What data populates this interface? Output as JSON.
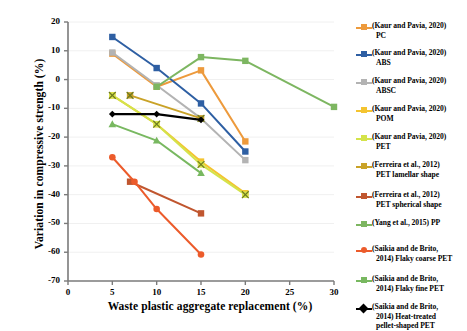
{
  "chart_data": {
    "type": "line",
    "title": "",
    "xlabel": "Waste plastic aggregate replacement (%)",
    "ylabel": "Variation in compressive strength (%)",
    "xlim": [
      0,
      30
    ],
    "ylim": [
      -70,
      20
    ],
    "xticks": [
      0,
      5,
      10,
      15,
      20,
      25,
      30
    ],
    "xticklabels": [
      "0",
      "5",
      "10",
      "15",
      "20",
      "25",
      "30"
    ],
    "yticks": [
      20,
      10,
      0,
      -10,
      -20,
      -30,
      -40,
      -50,
      -60,
      -70
    ],
    "yticklabels": [
      "20",
      "10",
      "0",
      "-10",
      "-20",
      "-30",
      "-40",
      "-50",
      "-60",
      "-70"
    ],
    "grid": false,
    "legend_position": "right",
    "series": [
      {
        "name": "(Kaur and Pavia, 2020) PC",
        "label_line1": "(Kaur and Pavia, 2020)",
        "label_line2": "PC",
        "color": "#ED9A3C",
        "marker": "square",
        "x": [
          5,
          10,
          15,
          20
        ],
        "y": [
          9.0,
          -2.5,
          3.2,
          -21.5
        ]
      },
      {
        "name": "(Kaur and Pavia, 2020) ABS",
        "label_line1": "(Kaur and Pavia, 2020)",
        "label_line2": "ABS",
        "color": "#2E5FA3",
        "marker": "square",
        "x": [
          5,
          10,
          15,
          20
        ],
        "y": [
          14.8,
          4.0,
          -8.3,
          -25.0
        ]
      },
      {
        "name": "(Kaur and Pavia, 2020) ABSC",
        "label_line1": "(Kaur and Pavia, 2020)",
        "label_line2": "ABSC",
        "color": "#B3B3B3",
        "marker": "square",
        "x": [
          5,
          10,
          15,
          20
        ],
        "y": [
          9.4,
          -2.0,
          -13.5,
          -28.0
        ]
      },
      {
        "name": "(Kaur and Pavia, 2020) POM",
        "label_line1": "(Kaur and Pavia, 2020)",
        "label_line2": "POM",
        "color": "#F4C430",
        "marker": "square",
        "x": [
          5,
          10,
          15,
          20
        ],
        "y": [
          -5.5,
          -15.5,
          -28.5,
          -39.5
        ]
      },
      {
        "name": "(Kaur and Pavia, 2020) PET",
        "label_line1": "(Kaur and Pavia, 2020)",
        "label_line2": "PET",
        "color": "#D4E34A",
        "marker": "x-square",
        "x": [
          5,
          10,
          15,
          20
        ],
        "y": [
          -5.5,
          -15.5,
          -29.5,
          -40.0
        ]
      },
      {
        "name": "(Ferreira et al., 2012) PET lamellar shape",
        "label_line1": "(Ferreira et al., 2012)",
        "label_line2": "PET lamellar shape",
        "color": "#C9A227",
        "marker": "x-square",
        "x": [
          7,
          15
        ],
        "y": [
          -5.5,
          -13.5
        ]
      },
      {
        "name": "(Ferreira et al., 2012) PET spherical shape",
        "label_line1": "(Ferreira et al., 2012)",
        "label_line2": "PET spherical shape",
        "color": "#C0562F",
        "marker": "square",
        "x": [
          7,
          15
        ],
        "y": [
          -35.5,
          -46.5
        ]
      },
      {
        "name": "(Yang et al., 2015) PP",
        "label_line1": "(Yang et al., 2015) PP",
        "label_line2": "",
        "color": "#7DB661",
        "marker": "square",
        "x": [
          10,
          15,
          20,
          30
        ],
        "y": [
          -2.5,
          7.8,
          6.5,
          -9.5
        ]
      },
      {
        "name": "(Saikia and de Brito, 2014) Flaky coarse PET",
        "label_line1": "(Saikia and de Brito,",
        "label_line2": "2014) Flaky coarse PET",
        "color": "#EC5B2B",
        "marker": "circle",
        "x": [
          5,
          7.5,
          10,
          15
        ],
        "y": [
          -27.0,
          -35.5,
          -45.0,
          -60.8
        ]
      },
      {
        "name": "(Saikia and de Brito, 2014) Flaky fine PET",
        "label_line1": "(Saikia and de Brito,",
        "label_line2": "2014) Flaky fine PET",
        "color": "#78B860",
        "marker": "triangle",
        "x": [
          5,
          10,
          15
        ],
        "y": [
          -15.5,
          -21.2,
          -32.5
        ]
      },
      {
        "name": "(Saikia and de Brito, 2014) Heat-treated pellet-shaped PET",
        "label_line1": "(Saikia and de Brito,",
        "label_line2": "2014) Heat-treated",
        "label_line3": "pellet-shaped PET",
        "color": "#000000",
        "marker": "diamond",
        "x": [
          5,
          10,
          15
        ],
        "y": [
          -12.0,
          -12.0,
          -14.0
        ]
      }
    ]
  },
  "axes": {
    "x_title": "Waste plastic aggregate replacement (%)",
    "y_title": "Variation in compressive strength (%)"
  },
  "legend": {
    "items": [
      {
        "line1": "(Kaur and Pavia, 2020)",
        "line2": "PC",
        "line3": "",
        "color": "#ED9A3C",
        "marker": "square",
        "top": 11
      },
      {
        "line1": "(Kaur and Pavia, 2020)",
        "line2": "ABS",
        "line3": "",
        "color": "#2E5FA3",
        "marker": "square",
        "top": 38
      },
      {
        "line1": "(Kaur and Pavia, 2020)",
        "line2": "ABSC",
        "line3": "",
        "color": "#B3B3B3",
        "marker": "square",
        "top": 66
      },
      {
        "line1": "(Kaur and Pavia, 2020)",
        "line2": "POM",
        "line3": "",
        "color": "#F4C430",
        "marker": "square",
        "top": 94
      },
      {
        "line1": "(Kaur and Pavia, 2020)",
        "line2": "PET",
        "line3": "",
        "color": "#D4E34A",
        "marker": "x-square",
        "top": 122
      },
      {
        "line1": "(Ferreira et al., 2012)",
        "line2": "PET lamellar shape",
        "line3": "",
        "color": "#C9A227",
        "marker": "x-square",
        "top": 150
      },
      {
        "line1": "(Ferreira et al., 2012)",
        "line2": "PET spherical shape",
        "line3": "",
        "color": "#C0562F",
        "marker": "square",
        "top": 180
      },
      {
        "line1": "(Yang et al., 2015) PP",
        "line2": "",
        "line3": "",
        "color": "#7DB661",
        "marker": "square",
        "top": 208
      },
      {
        "line1": "(Saikia and de Brito,",
        "line2": "2014) Flaky coarse PET",
        "line3": "",
        "color": "#EC5B2B",
        "marker": "circle",
        "top": 234
      },
      {
        "line1": "(Saikia and de Brito,",
        "line2": "2014) Flaky fine PET",
        "line3": "",
        "color": "#78B860",
        "marker": "triangle",
        "top": 264
      },
      {
        "line1": "(Saikia and de Brito,",
        "line2": "2014) Heat-treated",
        "line3": "pellet-shaped PET",
        "color": "#000000",
        "marker": "diamond",
        "top": 292
      }
    ]
  }
}
